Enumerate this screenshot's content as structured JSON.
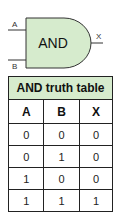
{
  "gate": {
    "label": "AND",
    "input_a": "A",
    "input_b": "B",
    "output": "X",
    "fill_color": "#d6ebcd",
    "stroke_color": "#333333"
  },
  "truth_table": {
    "title": "AND truth table",
    "title_bg": "#d6ebcd",
    "columns": [
      "A",
      "B",
      "X"
    ],
    "rows": [
      [
        "0",
        "0",
        "0"
      ],
      [
        "0",
        "1",
        "0"
      ],
      [
        "1",
        "0",
        "0"
      ],
      [
        "1",
        "1",
        "1"
      ]
    ]
  }
}
